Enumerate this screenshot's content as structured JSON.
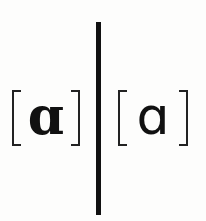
{
  "diagram": {
    "left": {
      "open_bracket": "[",
      "symbol": "ɑ",
      "close_bracket": "]",
      "weight": "bold"
    },
    "right": {
      "open_bracket": "[",
      "symbol": "ɑ",
      "close_bracket": "]",
      "weight": "regular"
    },
    "colors": {
      "background": "#fdfdfc",
      "ink": "#111111"
    }
  }
}
